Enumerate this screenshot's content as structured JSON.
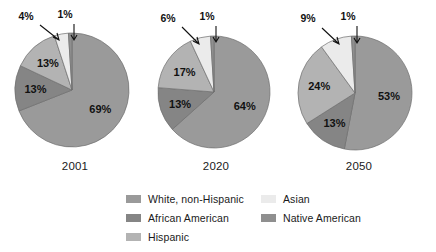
{
  "chart_data": {
    "type": "pie",
    "title": "",
    "legend_position": "bottom",
    "series": [
      {
        "name": "2001",
        "year_label": "2001",
        "categories": [
          "White, non-Hispanic",
          "African American",
          "Hispanic",
          "Asian",
          "Native American"
        ],
        "values": [
          69,
          13,
          13,
          4,
          1
        ],
        "labels": [
          "69%",
          "13%",
          "13%",
          "4%",
          "1%"
        ]
      },
      {
        "name": "2020",
        "year_label": "2020",
        "categories": [
          "White, non-Hispanic",
          "African American",
          "Hispanic",
          "Asian",
          "Native American"
        ],
        "values": [
          64,
          13,
          17,
          6,
          1
        ],
        "labels": [
          "64%",
          "13%",
          "17%",
          "6%",
          "1%"
        ]
      },
      {
        "name": "2050",
        "year_label": "2050",
        "categories": [
          "White, non-Hispanic",
          "African American",
          "Hispanic",
          "Asian",
          "Native American"
        ],
        "values": [
          53,
          13,
          24,
          9,
          1
        ],
        "labels": [
          "53%",
          "13%",
          "24%",
          "9%",
          "1%"
        ]
      }
    ]
  },
  "legend": {
    "columns": [
      {
        "items": [
          {
            "label": "White, non-Hispanic",
            "color": "#9a9a9a"
          },
          {
            "label": "African American",
            "color": "#858585"
          },
          {
            "label": "Hispanic",
            "color": "#b3b3b3"
          }
        ]
      },
      {
        "items": [
          {
            "label": "Asian",
            "color": "#ebebeb"
          },
          {
            "label": "Native American",
            "color": "#8f8f8f"
          }
        ]
      }
    ]
  },
  "colors": {
    "white_non_hispanic": "#9a9a9a",
    "african_american": "#858585",
    "hispanic": "#b3b3b3",
    "asian": "#ebebeb",
    "native_american": "#8f8f8f",
    "background": "#ffffff",
    "text": "#111111",
    "outline": "#6f6f6f"
  }
}
